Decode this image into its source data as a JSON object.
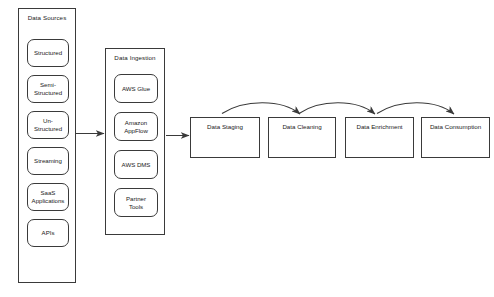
{
  "diagram": {
    "type": "flow-diagram",
    "stroke_color": "#3a3a3a",
    "text_color": "#1a1a1a",
    "background_color": "#ffffff"
  },
  "lanes": [
    {
      "id": "data-sources",
      "title": "Data Sources",
      "items": [
        {
          "id": "structured",
          "lines": [
            "Structured"
          ]
        },
        {
          "id": "semi-structured",
          "lines": [
            "Semi-",
            "Structured"
          ]
        },
        {
          "id": "un-structured",
          "lines": [
            "Un-",
            "Structured"
          ]
        },
        {
          "id": "streaming",
          "lines": [
            "Streaming"
          ]
        },
        {
          "id": "saas-applications",
          "lines": [
            "SaaS",
            "Applications"
          ]
        },
        {
          "id": "apis",
          "lines": [
            "APIs"
          ]
        }
      ]
    },
    {
      "id": "data-ingestion",
      "title": "Data Ingestion",
      "items": [
        {
          "id": "aws-glue",
          "lines": [
            "AWS Glue"
          ]
        },
        {
          "id": "amazon-appflow",
          "lines": [
            "Amazon",
            "AppFlow"
          ]
        },
        {
          "id": "aws-dms",
          "lines": [
            "AWS DMS"
          ]
        },
        {
          "id": "partner-tools",
          "lines": [
            "Partner",
            "Tools"
          ]
        }
      ]
    }
  ],
  "stages": [
    {
      "id": "data-staging",
      "label": "Data Staging"
    },
    {
      "id": "data-cleaning",
      "label": "Data Cleaning"
    },
    {
      "id": "data-enrichment",
      "label": "Data Enrichment"
    },
    {
      "id": "data-consumption",
      "label": "Data Consumption"
    }
  ],
  "connectors": [
    {
      "id": "sources-to-ingestion",
      "from": "data-sources",
      "to": "data-ingestion",
      "style": "straight-arrow"
    },
    {
      "id": "ingestion-to-staging",
      "from": "data-ingestion",
      "to": "data-staging",
      "style": "straight-arrow"
    },
    {
      "id": "staging-to-cleaning",
      "from": "data-staging",
      "to": "data-cleaning",
      "style": "curved-arrow"
    },
    {
      "id": "cleaning-to-enrichment",
      "from": "data-cleaning",
      "to": "data-enrichment",
      "style": "curved-arrow"
    },
    {
      "id": "enrichment-to-consumption",
      "from": "data-enrichment",
      "to": "data-consumption",
      "style": "curved-arrow"
    }
  ]
}
